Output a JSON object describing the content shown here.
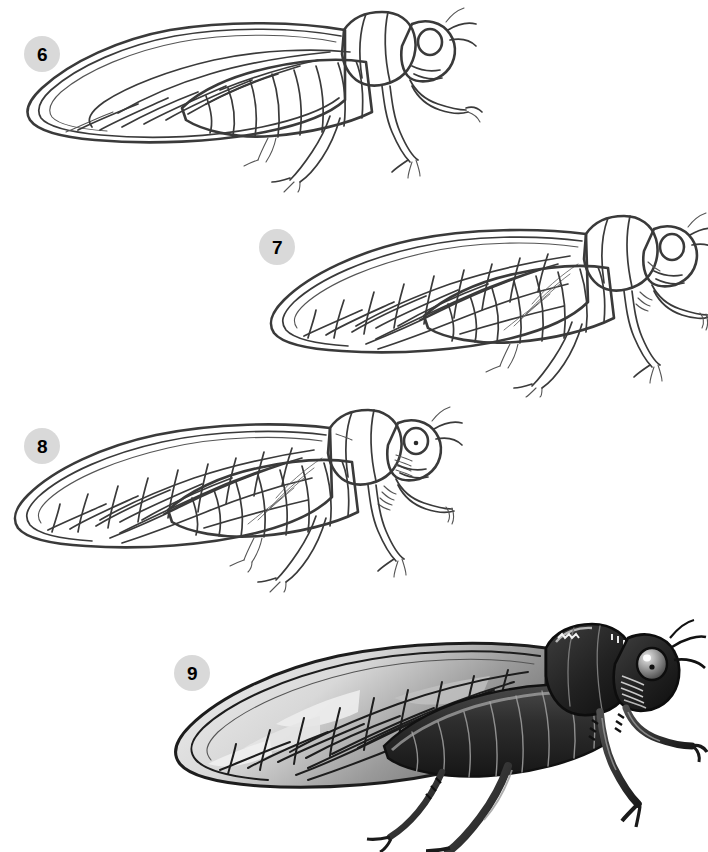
{
  "document": {
    "kind": "drawing-tutorial",
    "subject": "cicada",
    "background_color": "#ffffff",
    "line_color": "#3a3a3a",
    "badge_color": "#d9d9d9",
    "badge_text_color": "#000000",
    "shade_dark": "#2b2b2b",
    "shade_mid": "#8d8d8d",
    "shade_light": "#d2d2d2"
  },
  "steps": [
    {
      "number": "6",
      "name": "step-6",
      "caption": "",
      "description": "Cicada outline with single forewing showing main longitudinal veins, segmented abdomen, head with eye and antennae, three legs",
      "shaded": false,
      "badge": {
        "x": 24,
        "y": 36
      }
    },
    {
      "number": "7",
      "name": "step-7",
      "caption": "",
      "description": "Cicada with complete forewing vein network including cross-veins forming cells",
      "shaded": false,
      "badge": {
        "x": 259,
        "y": 229
      }
    },
    {
      "number": "8",
      "name": "step-8",
      "caption": "",
      "description": "Cicada with refined details: eye pupil, facial striations, leg spines, cleaned wing cells",
      "shaded": false,
      "badge": {
        "x": 24,
        "y": 428
      }
    },
    {
      "number": "9",
      "name": "step-9",
      "caption": "",
      "description": "Finished shaded cicada with dark body, highlighted eye, gray-toned translucent wing",
      "shaded": true,
      "badge": {
        "x": 174,
        "y": 655
      }
    }
  ]
}
